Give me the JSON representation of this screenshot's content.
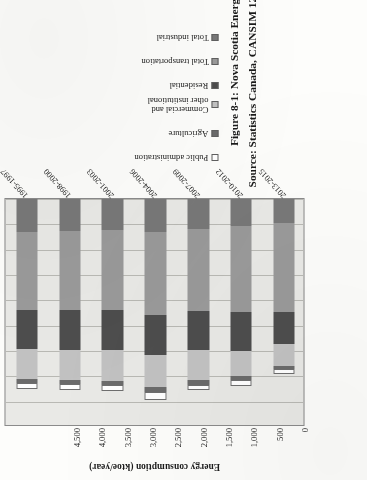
{
  "figure": {
    "caption_line1": "Figure 8-1: Nova Scotia Energy Consumption from 1995 to 2015",
    "caption_line2": "Source: Statistics Canada, CANSIM 128-0016"
  },
  "chart_data": {
    "type": "bar",
    "orientation": "horizontal-stacked",
    "title": "Figure 8-1: Nova Scotia Energy Consumption from 1995 to 2015",
    "xlabel": "",
    "ylabel": "Energy consumption (ktoe/year)",
    "ylim": [
      0,
      4500
    ],
    "tick_values": [
      0,
      500,
      1000,
      1500,
      2000,
      2500,
      3000,
      3500,
      4000,
      4500
    ],
    "tick_labels": [
      "0",
      "500",
      "1,000",
      "1,500",
      "2,000",
      "2,500",
      "3,000",
      "3,500",
      "4,000",
      "4,500"
    ],
    "grid": true,
    "legend_position": "right",
    "categories": [
      "1995-1997",
      "1998-2000",
      "2001-2003",
      "2004-2006",
      "2007-2009",
      "2010-2012",
      "2013-2015"
    ],
    "series": [
      {
        "name": "Total industrial",
        "color": "#787878",
        "values": [
          660,
          640,
          615,
          650,
          590,
          540,
          470
        ]
      },
      {
        "name": "Total transportation",
        "color": "#9a9a9a",
        "values": [
          1540,
          1550,
          1580,
          1640,
          1620,
          1700,
          1770
        ]
      },
      {
        "name": "Residential",
        "color": "#4d4d4d",
        "values": [
          760,
          790,
          790,
          790,
          770,
          760,
          620
        ]
      },
      {
        "name": "Commercial and other institutional",
        "color": "#c2c2c2",
        "values": [
          600,
          590,
          610,
          640,
          600,
          500,
          430
        ]
      },
      {
        "name": "Agriculture",
        "color": "#6b6b6b",
        "values": [
          80,
          85,
          85,
          90,
          85,
          80,
          70
        ]
      },
      {
        "name": "Public administration",
        "color": "#ffffff",
        "values": [
          110,
          120,
          120,
          150,
          115,
          110,
          90
        ]
      }
    ],
    "totals": [
      3750,
      3775,
      3800,
      3960,
      3780,
      3690,
      3450
    ]
  },
  "legend": {
    "items": [
      {
        "label": "Public administration",
        "label_line2": "",
        "color": "#ffffff"
      },
      {
        "label": "Agriculture",
        "label_line2": "",
        "color": "#6b6b6b"
      },
      {
        "label": "Commercial and",
        "label_line2": "other institutional",
        "color": "#c2c2c2"
      },
      {
        "label": "Residential",
        "label_line2": "",
        "color": "#4d4d4d"
      },
      {
        "label": "Total transportation",
        "label_line2": "",
        "color": "#9a9a9a"
      },
      {
        "label": "Total industrial",
        "label_line2": "",
        "color": "#787878"
      }
    ]
  }
}
